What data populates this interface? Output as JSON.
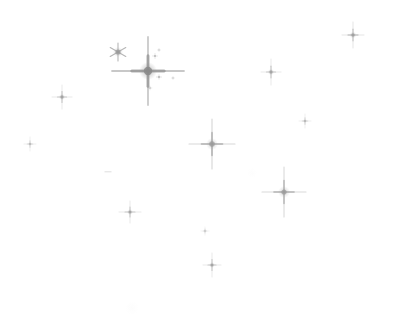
{
  "image": {
    "title": "Star field plate",
    "width": 393,
    "height": 317,
    "background_color": "#ffffff",
    "star_color": "#9a9a9a",
    "star_color_faint": "#c2c2c2",
    "star_color_bright": "#8a8a8a",
    "object_count": 17
  },
  "stars": [
    {
      "id": "star-bright-primary",
      "label": "Bright star with long diffraction spikes",
      "x": 148,
      "y": 71,
      "spike_h": 36,
      "spike_v": 34,
      "core": 4.2,
      "glow": 9,
      "opacity": 0.85,
      "type": "diffraction-4",
      "color": "#8a8a8a"
    },
    {
      "id": "star-asterisk",
      "label": "Six-pointed asterisk star",
      "x": 118,
      "y": 52,
      "spike_h": 8,
      "spike_v": 9,
      "core": 2.6,
      "glow": 5,
      "opacity": 0.72,
      "type": "asterisk-6",
      "color": "#9a9a9a"
    },
    {
      "id": "star-center",
      "label": "Central star with diffraction spikes",
      "x": 212,
      "y": 144,
      "spike_h": 23,
      "spike_v": 25,
      "core": 2.8,
      "glow": 6,
      "opacity": 0.7,
      "type": "diffraction-4",
      "color": "#9a9a9a"
    },
    {
      "id": "star-lower-right",
      "label": "Lower right star with diffraction spikes",
      "x": 284,
      "y": 192,
      "spike_h": 22,
      "spike_v": 25,
      "core": 2.6,
      "glow": 6,
      "opacity": 0.68,
      "type": "diffraction-4",
      "color": "#9a9a9a"
    },
    {
      "id": "star-top-right",
      "label": "Top right cross star",
      "x": 353,
      "y": 35,
      "spike_h": 11,
      "spike_v": 13,
      "core": 1.8,
      "glow": 3.5,
      "opacity": 0.62,
      "type": "cross-4",
      "color": "#9a9a9a"
    },
    {
      "id": "star-upper-right-mid",
      "label": "Upper right cross star",
      "x": 271,
      "y": 72,
      "spike_h": 10,
      "spike_v": 13,
      "core": 1.7,
      "glow": 3.2,
      "opacity": 0.6,
      "type": "cross-4",
      "color": "#9a9a9a"
    },
    {
      "id": "star-left-upper",
      "label": "Upper left cross star",
      "x": 62,
      "y": 97,
      "spike_h": 10,
      "spike_v": 12,
      "core": 1.7,
      "glow": 3.2,
      "opacity": 0.6,
      "type": "cross-4",
      "color": "#9a9a9a"
    },
    {
      "id": "star-left-edge",
      "label": "Left edge faint cross star",
      "x": 30,
      "y": 144,
      "spike_h": 6,
      "spike_v": 7,
      "core": 1.1,
      "glow": 2.2,
      "opacity": 0.48,
      "type": "cross-4",
      "color": "#a8a8a8"
    },
    {
      "id": "star-lower-left",
      "label": "Lower left cross star",
      "x": 130,
      "y": 212,
      "spike_h": 11,
      "spike_v": 11,
      "core": 1.6,
      "glow": 3.0,
      "opacity": 0.58,
      "type": "cross-4",
      "color": "#9a9a9a"
    },
    {
      "id": "star-bottom-center",
      "label": "Bottom center cross star",
      "x": 212,
      "y": 265,
      "spike_h": 9,
      "spike_v": 12,
      "core": 1.6,
      "glow": 3.0,
      "opacity": 0.58,
      "type": "cross-4",
      "color": "#9a9a9a"
    },
    {
      "id": "star-right-faint",
      "label": "Right side faint cross star",
      "x": 305,
      "y": 121,
      "spike_h": 6,
      "spike_v": 7,
      "core": 1.1,
      "glow": 2.2,
      "opacity": 0.5,
      "type": "cross-4",
      "color": "#a8a8a8"
    },
    {
      "id": "star-tiny-lower-center",
      "label": "Tiny faint star below center",
      "x": 205,
      "y": 231,
      "spike_h": 4,
      "spike_v": 4,
      "core": 0.9,
      "glow": 1.8,
      "opacity": 0.42,
      "type": "cross-4",
      "color": "#b4b4b4"
    },
    {
      "id": "star-companion-a",
      "label": "Companion speck above bright star",
      "x": 155,
      "y": 56,
      "spike_h": 2.4,
      "spike_v": 2.4,
      "core": 0.9,
      "glow": 1.6,
      "opacity": 0.5,
      "type": "speck",
      "color": "#a0a0a0"
    },
    {
      "id": "star-companion-b",
      "label": "Companion speck upper right of bright star",
      "x": 159,
      "y": 50,
      "spike_h": 1.6,
      "spike_v": 1.6,
      "core": 0.7,
      "glow": 1.2,
      "opacity": 0.42,
      "type": "speck",
      "color": "#adadad"
    },
    {
      "id": "star-companion-c",
      "label": "Companion speck right of bright star",
      "x": 159,
      "y": 77,
      "spike_h": 2.6,
      "spike_v": 2.2,
      "core": 1.0,
      "glow": 1.8,
      "opacity": 0.5,
      "type": "speck",
      "color": "#a0a0a0"
    },
    {
      "id": "star-companion-d",
      "label": "Companion speck below bright star",
      "x": 150,
      "y": 88,
      "spike_h": 1.8,
      "spike_v": 1.8,
      "core": 0.8,
      "glow": 1.4,
      "opacity": 0.45,
      "type": "speck",
      "color": "#a8a8a8"
    },
    {
      "id": "star-companion-e",
      "label": "Far companion speck right of bright star",
      "x": 173,
      "y": 78,
      "spike_h": 1.6,
      "spike_v": 1.6,
      "core": 0.7,
      "glow": 1.2,
      "opacity": 0.4,
      "type": "speck",
      "color": "#b0b0b0"
    }
  ],
  "marks": [
    {
      "id": "dash-left-center",
      "label": "Short horizontal dash artifact",
      "x": 108,
      "y": 172,
      "width": 7,
      "height": 1.4,
      "opacity": 0.4,
      "color": "#b0b0b0"
    }
  ],
  "smudges": [
    {
      "id": "smudge-bottom",
      "label": "Faint plate smudge near bottom",
      "x": 132,
      "y": 308,
      "size": 14,
      "opacity": 0.05,
      "color": "#c8c8c8"
    },
    {
      "id": "smudge-upper-right",
      "label": "Faint plate smudge upper right",
      "x": 252,
      "y": 173,
      "size": 10,
      "opacity": 0.04,
      "color": "#c8c8c8"
    }
  ]
}
